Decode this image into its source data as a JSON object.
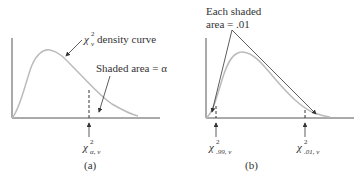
{
  "panel_a": {
    "caption": "(a)",
    "curve_label": "density curve",
    "curve_label_symbol": "χ",
    "curve_label_sup": "2",
    "curve_label_sub": "ν",
    "shaded_label": "Shaded area = α",
    "critical_symbol": "χ",
    "critical_sup": "2",
    "critical_sub": "α, ν"
  },
  "panel_b": {
    "caption": "(b)",
    "shaded_label_line1": "Each shaded",
    "shaded_label_line2": "area = .01",
    "left_critical_symbol": "χ",
    "left_critical_sup": "2",
    "left_critical_sub": ".99, ν",
    "right_critical_symbol": "χ",
    "right_critical_sup": "2",
    "right_critical_sub": ".01, ν"
  },
  "colors": {
    "axis": "#555555",
    "curve": "#bbbbbb",
    "annotation": "#333333"
  }
}
